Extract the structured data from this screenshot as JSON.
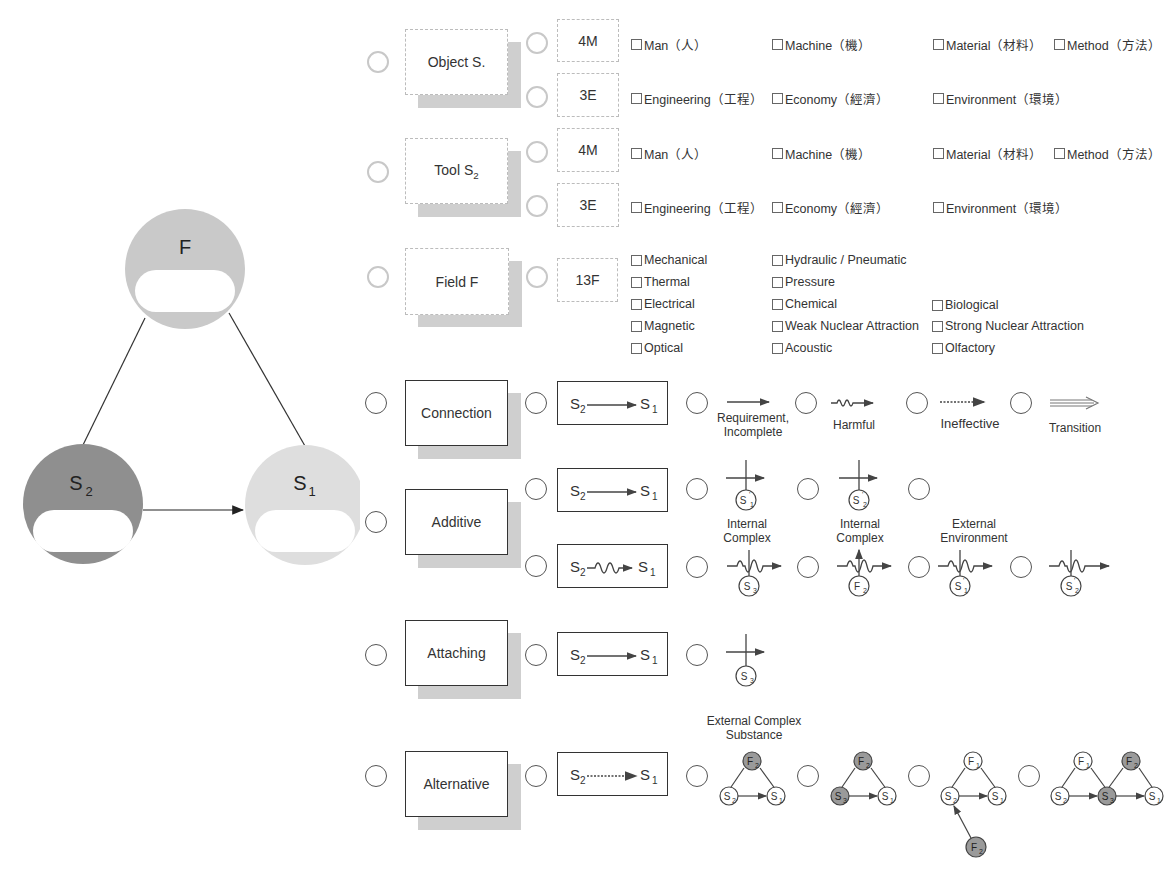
{
  "triad": {
    "nodes": [
      {
        "id": "F",
        "label": "F",
        "color": "#c9c9c9"
      },
      {
        "id": "S2",
        "label": "S",
        "sub": "2",
        "color": "#8f8f8f"
      },
      {
        "id": "S1",
        "label": "S",
        "sub": "1",
        "color": "#dedede"
      }
    ]
  },
  "rows": {
    "object": {
      "title": "Object S.",
      "groups": [
        {
          "code": "4M",
          "options": [
            "Man（人）",
            "Machine（機）",
            "Material（材料）",
            "Method（方法）"
          ]
        },
        {
          "code": "3E",
          "options": [
            "Engineering（工程）",
            "Economy（經濟）",
            "Environment（環境）"
          ]
        }
      ]
    },
    "tool": {
      "title": "Tool S",
      "title_sub": "2",
      "groups": [
        {
          "code": "4M",
          "options": [
            "Man（人）",
            "Machine（機）",
            "Material（材料）",
            "Method（方法）"
          ]
        },
        {
          "code": "3E",
          "options": [
            "Engineering（工程）",
            "Economy（經濟）",
            "Environment（環境）"
          ]
        }
      ]
    },
    "field": {
      "title": "Field F",
      "code": "13F",
      "options": [
        "Mechanical",
        "Hydraulic / Pneumatic",
        "Thermal",
        "Pressure",
        "Electrical",
        "Chemical",
        "Biological",
        "Magnetic",
        "Weak Nuclear Attraction",
        "Strong Nuclear Attraction",
        "Optical",
        "Acoustic",
        "Olfactory"
      ]
    },
    "connection": {
      "title": "Connection",
      "formula": {
        "left": "S",
        "left_sub": "2",
        "right": "S",
        "right_sub": "1",
        "arrow": "solid"
      },
      "options": [
        {
          "label_line1": "Requirement,",
          "label_line2": "Incomplete",
          "arrow": "solid"
        },
        {
          "label_line1": "Harmful",
          "arrow": "wavy"
        },
        {
          "label_line1": "Ineffective",
          "arrow": "dashed"
        },
        {
          "label_line1": "Transition",
          "arrow": "double"
        }
      ]
    },
    "additive": {
      "title": "Additive",
      "formulas": [
        {
          "left": "S",
          "left_sub": "2",
          "right": "S",
          "right_sub": "1",
          "arrow": "solid"
        },
        {
          "left": "S",
          "left_sub": "2",
          "right": "S",
          "right_sub": "1",
          "arrow": "wavy"
        }
      ],
      "top_options": [
        {
          "node": "S",
          "node_sub": "1",
          "prime": true,
          "caption_line1": "Internal",
          "caption_line2": "Complex"
        },
        {
          "node": "S",
          "node_sub": "2",
          "prime": true,
          "caption_line1": "Internal",
          "caption_line2": "Complex"
        },
        {
          "node": "",
          "caption_line1": "External",
          "caption_line2": "Environment"
        }
      ],
      "bottom_options": [
        {
          "node": "S",
          "node_sub": "3"
        },
        {
          "node": "F",
          "node_sub": "2"
        },
        {
          "node": "S",
          "node_sub": "1",
          "prime": true
        },
        {
          "node": "S",
          "node_sub": "2",
          "prime": true
        }
      ]
    },
    "attaching": {
      "title": "Attaching",
      "formula": {
        "left": "S",
        "left_sub": "2",
        "right": "S",
        "right_sub": "1",
        "arrow": "solid"
      },
      "options": [
        {
          "node": "S",
          "node_sub": "3"
        }
      ]
    },
    "alternative": {
      "title": "Alternative",
      "formula": {
        "left": "S",
        "left_sub": "2",
        "right": "S",
        "right_sub": "1",
        "arrow": "dashed"
      },
      "caption_line1": "External Complex",
      "caption_line2": "Substance",
      "options": [
        {
          "nodes": [
            "F2*",
            "S2",
            "S1"
          ]
        },
        {
          "nodes": [
            "F2*",
            "S3*",
            "S1"
          ]
        },
        {
          "nodes": [
            "F1",
            "S2",
            "S1",
            "F2*"
          ]
        },
        {
          "nodes": [
            "F1",
            "S2",
            "S3*",
            "F2*",
            "S1"
          ]
        }
      ]
    }
  },
  "colors": {
    "shade": "#cfcfcf",
    "dark_node": "#8f8f8f",
    "light_node": "#dedede",
    "mid_node": "#c9c9c9",
    "line": "#333333",
    "small_node_fill": "#9a9a9a"
  }
}
